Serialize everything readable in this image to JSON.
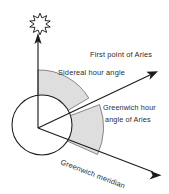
{
  "figure": {
    "background_color": "#ffffff",
    "ink_color": "#1c1c1c",
    "shade_color": "#dcdcdc",
    "labels": {
      "first_point_of_aries": "First point of Aries",
      "sidereal_hour_angle": "Sidereal hour angle",
      "greenwich_hour_angle_line1": "Greenwich hour",
      "greenwich_hour_angle_line2": "angle of Aries",
      "greenwich_meridian": "Greenwich meridian"
    },
    "elements": {
      "sun_symbol": "sun-star",
      "earth": "earth-circle",
      "ray_to_sun": "vertical-arrow-up",
      "ray_to_aries": "arrow-upper-right",
      "ray_greenwich_meridian": "arrow-lower-right",
      "sector_sidereal": "shaded-sector-upper",
      "sector_greenwich": "shaded-sector-lower"
    },
    "geometry": {
      "center_x": 38,
      "center_y": 128,
      "earth_center_x": 42,
      "earth_center_y": 125,
      "earth_radius": 30,
      "sun_x": 40,
      "sun_y": 22
    }
  }
}
